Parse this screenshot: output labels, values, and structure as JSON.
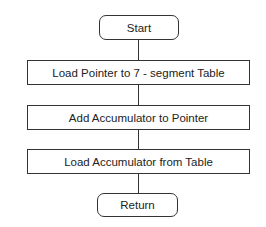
{
  "diagram": {
    "type": "flowchart",
    "nodes": [
      {
        "id": "start",
        "shape": "terminal",
        "label": "Start"
      },
      {
        "id": "step1",
        "shape": "process",
        "label": "Load Pointer to 7 - segment Table"
      },
      {
        "id": "step2",
        "shape": "process",
        "label": "Add Accumulator to Pointer"
      },
      {
        "id": "step3",
        "shape": "process",
        "label": "Load Accumulator from Table"
      },
      {
        "id": "return",
        "shape": "terminal",
        "label": "Return"
      }
    ],
    "edges": [
      {
        "from": "start",
        "to": "step1"
      },
      {
        "from": "step1",
        "to": "step2"
      },
      {
        "from": "step2",
        "to": "step3"
      },
      {
        "from": "step3",
        "to": "return"
      }
    ]
  }
}
